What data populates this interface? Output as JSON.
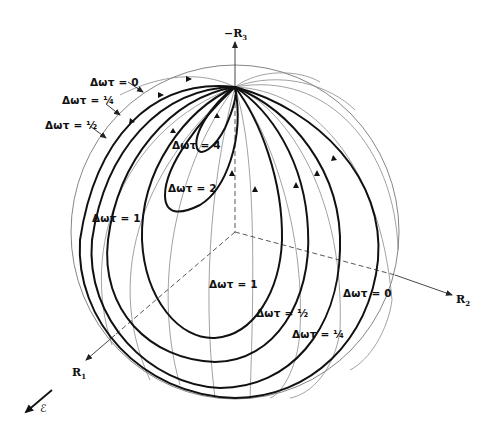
{
  "figure": {
    "type": "Bloch sphere trajectories",
    "axes": {
      "vertical": {
        "label": "−R",
        "subscript": "3"
      },
      "right": {
        "label": "R",
        "subscript": "2"
      },
      "left": {
        "label": "R",
        "subscript": "1"
      }
    },
    "field_vector": {
      "label": "ℰ"
    }
  },
  "curves_upper_left": [
    {
      "label": "Δωτ = 0"
    },
    {
      "label": "Δωτ = ¼"
    },
    {
      "label": "Δωτ = ½"
    }
  ],
  "curves_inner": [
    {
      "label": "Δωτ = 4"
    },
    {
      "label": "Δωτ = 2"
    },
    {
      "label": "Δωτ = 1"
    }
  ],
  "curves_lower_right": [
    {
      "label": "Δωτ = 1"
    },
    {
      "label": "Δωτ = ½"
    },
    {
      "label": "Δωτ = ¼"
    },
    {
      "label": "Δωτ = 0"
    }
  ],
  "colors": {
    "trajectory": "#111111",
    "meridian": "#8a8a8a",
    "background": "#ffffff"
  }
}
